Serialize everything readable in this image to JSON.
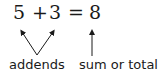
{
  "equation": {
    "addend1": "5",
    "plus": "+",
    "addend2": "3",
    "equals": "=",
    "sum": "8"
  },
  "labels": {
    "addends": "addends",
    "sum": "sum or total"
  },
  "colors": {
    "ink": "#1a1a1a",
    "background": "#ffffff"
  }
}
